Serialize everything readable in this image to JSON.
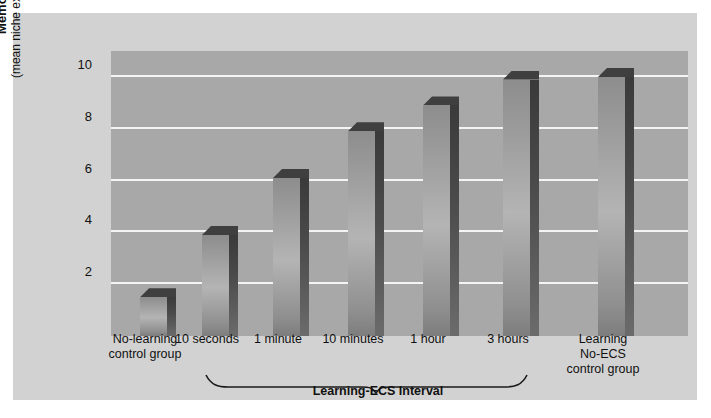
{
  "chart_data": {
    "type": "bar",
    "title": "",
    "xlabel": "",
    "ylabel": "Memory",
    "ylabel_sub": "(mean niche explorations)",
    "ylim": [
      0,
      11
    ],
    "yticks": [
      2,
      4,
      6,
      8,
      10
    ],
    "grid": true,
    "legend": "none",
    "categories": [
      "No-learning control group",
      "10 seconds",
      "1 minute",
      "10 minutes",
      "1 hour",
      "3 hours",
      "Learning No-ECS control group"
    ],
    "values": [
      1.5,
      3.9,
      6.1,
      7.9,
      8.9,
      9.9,
      10.0
    ],
    "group_bracket": {
      "label": "Learning-ECS Interval",
      "covers": [
        "10 seconds",
        "1 minute",
        "10 minutes",
        "1 hour",
        "3 hours"
      ]
    }
  },
  "axis": {
    "y_title_bold": "Memory",
    "y_title_sub": "(mean niche explorations)",
    "tick_labels": [
      "10",
      "8",
      "6",
      "4",
      "2"
    ]
  },
  "categories": [
    {
      "line1": "No-learning",
      "line2": "control group",
      "line3": ""
    },
    {
      "line1": "10 seconds",
      "line2": "",
      "line3": ""
    },
    {
      "line1": "1 minute",
      "line2": "",
      "line3": ""
    },
    {
      "line1": "10 minutes",
      "line2": "",
      "line3": ""
    },
    {
      "line1": "1 hour",
      "line2": "",
      "line3": ""
    },
    {
      "line1": "3 hours",
      "line2": "",
      "line3": ""
    },
    {
      "line1": "Learning",
      "line2": "No-ECS",
      "line3": "control group"
    }
  ],
  "group": {
    "label": "Learning-ECS Interval"
  },
  "colors": {
    "page_background": "#ffffff",
    "panel_background": "#d2d2d2",
    "plot_background": "#a8a8a8",
    "gridline": "#f4f4f4",
    "bar_front_light": "#b4b4b4",
    "bar_front_dark": "#7d7d7d",
    "bar_side_dark": "#3a3a3a",
    "bar_top": "#3f3f3f",
    "text": "#111111"
  }
}
